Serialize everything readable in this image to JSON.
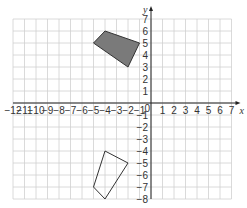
{
  "diagram": {
    "type": "coordinate-grid",
    "x_axis": {
      "label": "x",
      "min": -12,
      "max": 7,
      "ticks": [
        -12,
        -11,
        -10,
        -9,
        -8,
        -7,
        -6,
        -5,
        -4,
        -3,
        -2,
        -1,
        1,
        2,
        3,
        4,
        5,
        6,
        7
      ]
    },
    "y_axis": {
      "label": "y",
      "min": -8,
      "max": 7,
      "ticks": [
        7,
        6,
        5,
        4,
        3,
        2,
        1,
        -1,
        -2,
        -3,
        -4,
        -5,
        -6,
        -7,
        -8
      ]
    },
    "origin_label": "0",
    "shapes": [
      {
        "name": "shaded-quadrilateral",
        "fill": "#7a7a7a",
        "stroke": "#333333",
        "vertices": [
          [
            -5,
            5
          ],
          [
            -4,
            6
          ],
          [
            -1,
            5
          ],
          [
            -2,
            3
          ]
        ]
      },
      {
        "name": "outline-quadrilateral",
        "fill": "none",
        "stroke": "#333333",
        "vertices": [
          [
            -4,
            -4
          ],
          [
            -2,
            -5
          ],
          [
            -4,
            -8
          ],
          [
            -5,
            -7
          ]
        ]
      }
    ]
  },
  "colors": {
    "grid": "#d0d0d0",
    "axis": "#222222",
    "shaded": "#7a7a7a"
  }
}
